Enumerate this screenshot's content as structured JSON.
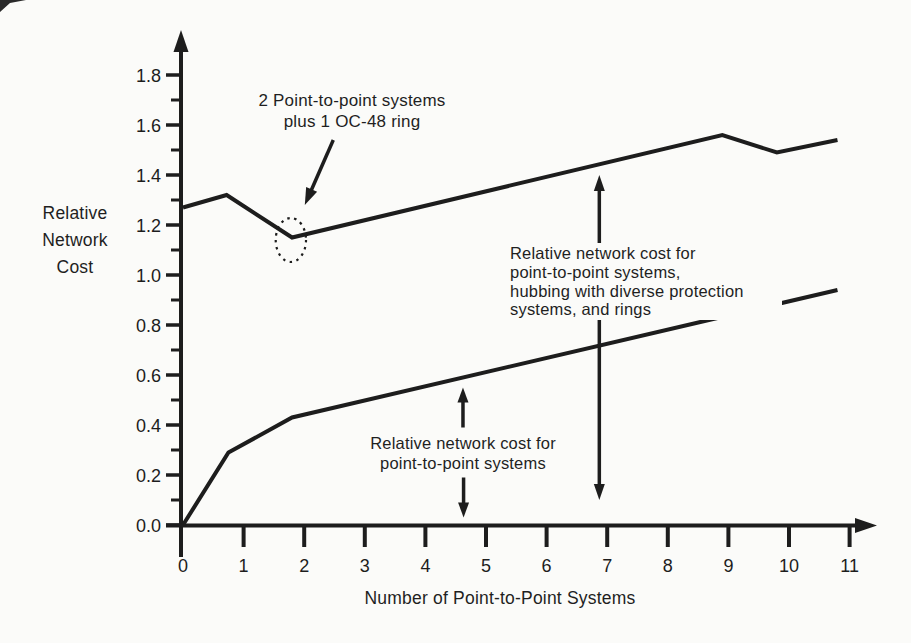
{
  "figure": {
    "paper_color": "#fbfbf9",
    "ink_color": "#1d1d1d"
  },
  "chart_data": {
    "type": "line",
    "title": "",
    "xlabel": "Number of Point-to-Point Systems",
    "ylabel": "Relative Network Cost",
    "ylabel_lines": [
      "Relative",
      "Network",
      "Cost"
    ],
    "xlim": [
      0,
      11.5
    ],
    "ylim": [
      0,
      1.95
    ],
    "grid": false,
    "legend_position": "none",
    "x_tick_labels": [
      "0",
      "1",
      "2",
      "3",
      "4",
      "5",
      "6",
      "7",
      "8",
      "9",
      "10",
      "11"
    ],
    "y_major_tick_labels": [
      "0.0",
      "0.2",
      "0.4",
      "0.6",
      "0.8",
      "1.0",
      "1.2",
      "1.4",
      "1.6",
      "1.8"
    ],
    "y_minor_ticks": [
      0.1,
      0.3,
      0.5,
      0.7,
      0.9,
      1.1,
      1.3,
      1.5,
      1.7
    ],
    "series": [
      {
        "name": "Relative network cost for point-to-point systems, hubbing with diverse protection systems, and rings",
        "points": [
          [
            0,
            1.27
          ],
          [
            0.72,
            1.32
          ],
          [
            1.8,
            1.15
          ],
          [
            8.9,
            1.56
          ],
          [
            9.8,
            1.49
          ],
          [
            10.8,
            1.54
          ]
        ]
      },
      {
        "name": "Relative network cost for point-to-point systems",
        "points": [
          [
            0,
            0.0
          ],
          [
            0.75,
            0.29
          ],
          [
            1.8,
            0.43
          ],
          [
            10.8,
            0.94
          ]
        ]
      }
    ],
    "annotations": {
      "ring_callout": {
        "lines": [
          "2 Point-to-point systems",
          "plus 1 OC-48 ring"
        ],
        "arrow_from": [
          2.48,
          1.54
        ],
        "arrow_to": [
          2.01,
          1.28
        ],
        "ellipse_center": [
          1.78,
          1.14
        ],
        "ellipse_rx": 0.25,
        "ellipse_ry": 0.088
      },
      "upper_series_label": {
        "lines": [
          "Relative network cost for",
          "point-to-point systems,",
          "hubbing with diverse protection",
          "systems, and rings"
        ],
        "double_arrow": {
          "x": 6.87,
          "y_top": 1.4,
          "y_bottom": 0.1
        }
      },
      "lower_series_label": {
        "lines": [
          "Relative network cost for",
          "point-to-point systems"
        ],
        "arrow_up": {
          "x": 4.62,
          "y_tip": 0.55,
          "y_tail": 0.39
        },
        "arrow_down": {
          "x": 4.63,
          "y_tip": 0.03,
          "y_tail": 0.19
        }
      }
    }
  }
}
